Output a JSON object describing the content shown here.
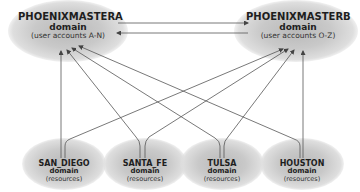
{
  "diagram": {
    "type": "domain-trust-relationships",
    "master_domains": [
      {
        "id": "a",
        "name": "PHOENIXMASTERA",
        "type_label": "domain",
        "description": "(user accounts A-N)"
      },
      {
        "id": "b",
        "name": "PHOENIXMASTERB",
        "type_label": "domain",
        "description": "(user accounts O-Z)"
      }
    ],
    "resource_domains": [
      {
        "id": "sd",
        "name": "SAN_DIEGO",
        "type_label": "domain",
        "description": "(resources)"
      },
      {
        "id": "sf",
        "name": "SANTA_FE",
        "type_label": "domain",
        "description": "(resources)"
      },
      {
        "id": "tu",
        "name": "TULSA",
        "type_label": "domain",
        "description": "(resources)"
      },
      {
        "id": "ho",
        "name": "HOUSTON",
        "type_label": "domain",
        "description": "(resources)"
      }
    ],
    "edges": [
      {
        "from": "PHOENIXMASTERA",
        "to": "PHOENIXMASTERB"
      },
      {
        "from": "PHOENIXMASTERB",
        "to": "PHOENIXMASTERA"
      },
      {
        "from": "SAN_DIEGO",
        "to": "PHOENIXMASTERA"
      },
      {
        "from": "SAN_DIEGO",
        "to": "PHOENIXMASTERB"
      },
      {
        "from": "SANTA_FE",
        "to": "PHOENIXMASTERA"
      },
      {
        "from": "SANTA_FE",
        "to": "PHOENIXMASTERB"
      },
      {
        "from": "TULSA",
        "to": "PHOENIXMASTERA"
      },
      {
        "from": "TULSA",
        "to": "PHOENIXMASTERB"
      },
      {
        "from": "HOUSTON",
        "to": "PHOENIXMASTERA"
      },
      {
        "from": "HOUSTON",
        "to": "PHOENIXMASTERB"
      }
    ],
    "colors": {
      "line": "#555555",
      "cloud": "#c4c4c4",
      "text": "#1e1e1e"
    }
  }
}
